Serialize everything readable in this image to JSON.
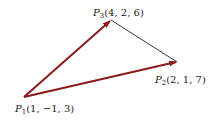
{
  "diagram": {
    "points": [
      {
        "name": "P",
        "sub": "1",
        "coords": "(1, −1, 3)"
      },
      {
        "name": "P",
        "sub": "2",
        "coords": "(2, 1, 7)"
      },
      {
        "name": "P",
        "sub": "3",
        "coords": "(4, 2, 6)"
      }
    ],
    "edges": [
      {
        "from": "P1",
        "to": "P3",
        "type": "vector-arrow",
        "color": "#8b1a1a"
      },
      {
        "from": "P1",
        "to": "P2",
        "type": "vector-arrow",
        "color": "#8b1a1a"
      },
      {
        "from": "P3",
        "to": "P2",
        "type": "line",
        "color": "#222222"
      }
    ]
  }
}
